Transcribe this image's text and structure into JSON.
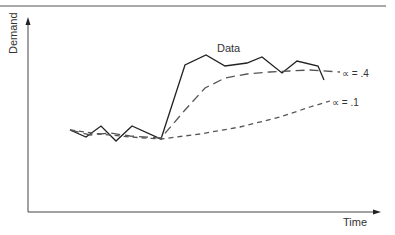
{
  "chart_data": {
    "type": "line",
    "title": "",
    "xlabel": "Time",
    "ylabel": "Demand",
    "grid": false,
    "legend": "inline labels at line ends",
    "series": [
      {
        "name": "Data",
        "style": "solid",
        "points": [
          [
            70,
            130
          ],
          [
            86,
            137
          ],
          [
            101,
            126
          ],
          [
            116,
            141
          ],
          [
            132,
            126
          ],
          [
            161,
            139
          ],
          [
            185,
            65
          ],
          [
            206,
            55
          ],
          [
            225,
            66
          ],
          [
            247,
            63
          ],
          [
            262,
            57
          ],
          [
            282,
            73
          ],
          [
            297,
            61
          ],
          [
            318,
            66
          ],
          [
            324,
            80
          ]
        ]
      },
      {
        "name": "α = .4",
        "style": "long-dash",
        "points": [
          [
            70,
            130
          ],
          [
            90,
            135
          ],
          [
            110,
            133
          ],
          [
            130,
            136
          ],
          [
            161,
            138
          ],
          [
            185,
            110
          ],
          [
            205,
            88
          ],
          [
            225,
            78
          ],
          [
            247,
            74
          ],
          [
            270,
            72
          ],
          [
            290,
            71
          ],
          [
            310,
            70
          ],
          [
            340,
            72
          ]
        ]
      },
      {
        "name": "α = .1",
        "style": "short-dash",
        "points": [
          [
            70,
            130
          ],
          [
            100,
            134
          ],
          [
            130,
            137
          ],
          [
            161,
            139
          ],
          [
            200,
            134
          ],
          [
            240,
            127
          ],
          [
            280,
            117
          ],
          [
            310,
            107
          ],
          [
            330,
            101
          ]
        ]
      }
    ],
    "annotations": [
      {
        "text": "Data",
        "x": 217,
        "y": 52
      },
      {
        "text": "α = .4",
        "x": 342,
        "y": 76
      },
      {
        "text": "α = .1",
        "x": 332,
        "y": 105
      }
    ]
  },
  "labels": {
    "data": "Data",
    "alpha4": "∝ = .4",
    "alpha1": "∝ = .1",
    "ylabel": "Demand",
    "xlabel": "Time"
  }
}
